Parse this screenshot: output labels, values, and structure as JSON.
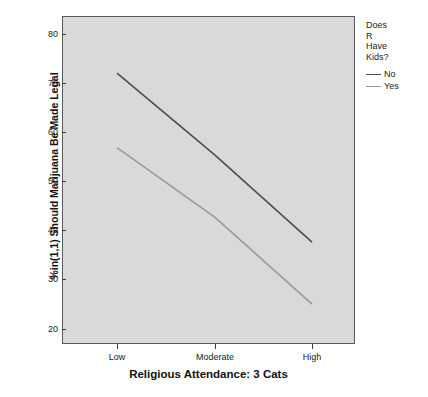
{
  "chart_data": {
    "type": "line",
    "title": "",
    "xlabel": "Religious Attendance: 3 Cats",
    "ylabel": "%in(1,1) Should Marijuana Be Made Legal",
    "categories": [
      "Low",
      "Moderate",
      "High"
    ],
    "ylim": [
      17,
      83
    ],
    "yticks": [
      20,
      30,
      40,
      50,
      60,
      70,
      80
    ],
    "ytick_labels": [
      "20",
      "30",
      "40",
      "50",
      "60",
      "70",
      "80"
    ],
    "grid": false,
    "legend_position": "right",
    "legend_title": "Does R Have Kids?",
    "legend_title_lines": [
      "Does",
      "R",
      "Have",
      "Kids?"
    ],
    "series": [
      {
        "name": "No",
        "values": [
          71.5,
          55.0,
          37.5
        ],
        "color": "#4d4d4d"
      },
      {
        "name": "Yes",
        "values": [
          56.5,
          42.5,
          25.0
        ],
        "color": "#9a9a9a"
      }
    ],
    "plot_background": "#d9d9d9",
    "frame_color": "#5a5a5a"
  },
  "yticks": {
    "t0": "80",
    "t1": "70",
    "t2": "60",
    "t3": "50",
    "t4": "40",
    "t5": "30",
    "t6": "20"
  },
  "xticks": {
    "t0": "Low",
    "t1": "Moderate",
    "t2": "High"
  },
  "axes": {
    "x_title": "Religious Attendance: 3 Cats",
    "y_title": "%in(1,1) Should Marijuana Be Made Legal"
  },
  "legend": {
    "title_line_1": "Does",
    "title_line_2": "R",
    "title_line_3": "Have",
    "title_line_4": "Kids?",
    "item_no": "No",
    "item_yes": "Yes"
  }
}
